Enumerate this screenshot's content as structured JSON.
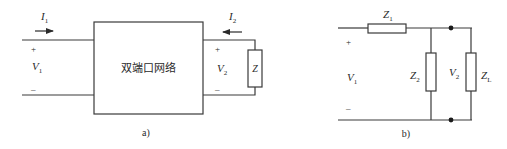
{
  "figure_a": {
    "caption": "a)",
    "network_label": "双端口网络",
    "input": {
      "current_label": "I",
      "current_sub": "1",
      "voltage_label": "V",
      "voltage_sub": "1",
      "plus": "+",
      "minus": "–"
    },
    "output": {
      "current_label": "I",
      "current_sub": "2",
      "voltage_label": "V",
      "voltage_sub": "2",
      "plus": "+",
      "minus": "–"
    },
    "load_label": "Z"
  },
  "figure_b": {
    "caption": "b)",
    "input": {
      "voltage_label": "V",
      "voltage_sub": "1",
      "plus": "+",
      "minus": "–"
    },
    "series_impedance": {
      "label": "Z",
      "sub": "1"
    },
    "shunt_impedance": {
      "label": "Z",
      "sub": "2"
    },
    "output_voltage": {
      "label": "V",
      "sub": "2"
    },
    "load_impedance": {
      "label": "Z",
      "sub": "L"
    }
  }
}
